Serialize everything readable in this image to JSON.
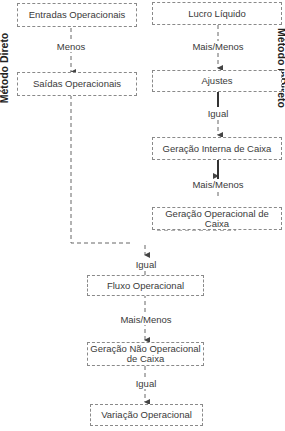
{
  "titles": {
    "left": "Método Direto",
    "right": "Método inDireto"
  },
  "boxes": {
    "entradas": "Entradas Operacionais",
    "saidas": "Saídas Operacionais",
    "lucro": "Lucro Líquido",
    "ajustes": "Ajustes",
    "geracao_interna": "Geração Interna de Caixa",
    "geracao_operacional": "Geração Operacional de Caixa",
    "fluxo": "Fluxo Operacional",
    "geracao_nao_operacional": "Geração Não Operacional de Caixa",
    "variacao": "Variação Operacional"
  },
  "connectors": {
    "menos": "Menos",
    "mais_menos_1": "Mais/Menos",
    "igual_1": "Igual",
    "mais_menos_2": "Mais/Menos",
    "igual_2": "Igual",
    "mais_menos_3": "Mais/Menos",
    "igual_3": "Igual"
  }
}
